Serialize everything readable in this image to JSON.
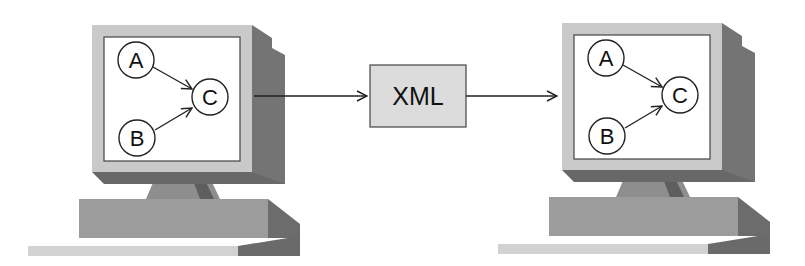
{
  "diagram": {
    "source_computer": {
      "screen_graph": {
        "nodes": [
          {
            "id": "A",
            "label": "A"
          },
          {
            "id": "B",
            "label": "B"
          },
          {
            "id": "C",
            "label": "C"
          }
        ],
        "edges": [
          {
            "from": "A",
            "to": "C"
          },
          {
            "from": "B",
            "to": "C"
          }
        ]
      }
    },
    "transfer_box": {
      "label": "XML"
    },
    "target_computer": {
      "screen_graph": {
        "nodes": [
          {
            "id": "A",
            "label": "A"
          },
          {
            "id": "B",
            "label": "B"
          },
          {
            "id": "C",
            "label": "C"
          }
        ],
        "edges": [
          {
            "from": "A",
            "to": "C"
          },
          {
            "from": "B",
            "to": "C"
          }
        ]
      }
    },
    "flow": [
      "source_computer",
      "XML",
      "target_computer"
    ],
    "colors": {
      "bezel": "#c8c8c8",
      "side_dark": "#6e6e6e",
      "side_mid": "#8a8a8a",
      "base": "#9a9a9a",
      "keyboard": "#d0d0d0",
      "screen": "#ffffff",
      "line": "#222222",
      "box_fill": "#dcdcdc"
    }
  }
}
